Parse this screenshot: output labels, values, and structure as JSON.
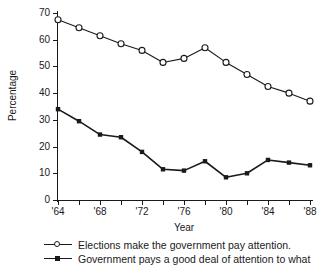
{
  "chart_data": {
    "type": "line",
    "title": "",
    "xlabel": "Year",
    "ylabel": "Percentage",
    "xlim": [
      1964,
      1988
    ],
    "ylim": [
      0,
      70
    ],
    "grid": false,
    "legend_position": "bottom-left",
    "x": [
      1964,
      1966,
      1968,
      1970,
      1972,
      1974,
      1976,
      1978,
      1980,
      1982,
      1984,
      1986,
      1988
    ],
    "xtick_labels": [
      "'64",
      "'68",
      "'72",
      "'76",
      "'80",
      "'84",
      "'88"
    ],
    "xtick_values": [
      1964,
      1968,
      1972,
      1976,
      1980,
      1984,
      1988
    ],
    "xtick_minor_values": [
      1966,
      1970,
      1974,
      1978,
      1982,
      1986
    ],
    "ytick_labels": [
      "0",
      "10",
      "20",
      "30",
      "40",
      "50",
      "60",
      "70"
    ],
    "ytick_values": [
      0,
      10,
      20,
      30,
      40,
      50,
      60,
      70
    ],
    "series": [
      {
        "name": "Elections make the government pay attention.",
        "marker": "open-circle",
        "color": "#1a1a1a",
        "values": [
          67.5,
          64.5,
          61.5,
          58.5,
          56,
          51.5,
          53,
          57,
          51.5,
          47,
          42.5,
          40,
          37
        ]
      },
      {
        "name": "Government pays a good deal of attention to what",
        "marker": "filled-square",
        "color": "#1a1a1a",
        "values": [
          34,
          29.5,
          24.5,
          23.5,
          18,
          11.5,
          11,
          14.5,
          8.5,
          10,
          15,
          14,
          13
        ]
      }
    ]
  },
  "legend": {
    "entries": [
      {
        "label": "Elections make the government pay attention.",
        "marker": "open-circle"
      },
      {
        "label": "Government pays a good deal of attention to what",
        "marker": "filled-square"
      }
    ]
  },
  "axes": {
    "y_title": "Percentage",
    "x_title": "Year"
  }
}
